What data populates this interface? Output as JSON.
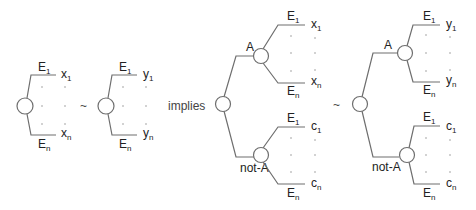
{
  "diagram": {
    "operators": {
      "similar": "~",
      "implies": "implies"
    },
    "event_first": {
      "base": "E",
      "sub": "1"
    },
    "event_last": {
      "base": "E",
      "sub": "n"
    },
    "branch_A": "A",
    "branch_notA": "not-A",
    "trees": [
      {
        "id": "tree-x",
        "outcomes": [
          {
            "base": "x",
            "sub": "1"
          },
          {
            "base": "x",
            "sub": "n"
          }
        ]
      },
      {
        "id": "tree-y",
        "outcomes": [
          {
            "base": "y",
            "sub": "1"
          },
          {
            "base": "y",
            "sub": "n"
          }
        ]
      },
      {
        "id": "compound-tree-x",
        "A_outcomes": [
          {
            "base": "x",
            "sub": "1"
          },
          {
            "base": "x",
            "sub": "n"
          }
        ],
        "notA_outcomes": [
          {
            "base": "c",
            "sub": "1"
          },
          {
            "base": "c",
            "sub": "n"
          }
        ]
      },
      {
        "id": "compound-tree-y",
        "A_outcomes": [
          {
            "base": "y",
            "sub": "1"
          },
          {
            "base": "y",
            "sub": "n"
          }
        ],
        "notA_outcomes": [
          {
            "base": "c",
            "sub": "1"
          },
          {
            "base": "c",
            "sub": "n"
          }
        ]
      }
    ]
  }
}
